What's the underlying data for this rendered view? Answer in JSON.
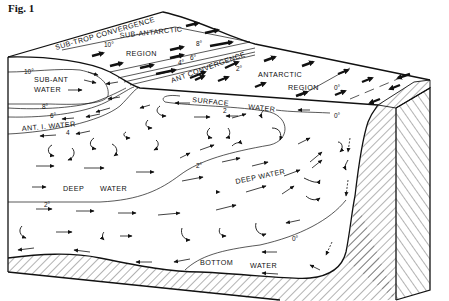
{
  "figure": {
    "title": "Fig. 1"
  },
  "surface_labels": {
    "sub_trop_convergence": "SUB-TROP CONVERGENCE",
    "sub_antarctic": "SUB-ANTARCTIC",
    "sub_antarctic_region": "REGION",
    "ant_convergence": "ANT CONVERGENCE",
    "antarctic": "ANTARCTIC",
    "antarctic_region": "REGION"
  },
  "water_masses": {
    "sub_ant_water_1": "SUB-ANT",
    "sub_ant_water_2": "WATER",
    "ant_i_water": "ANT. I. WATER",
    "surface_water_1": "SURFACE",
    "surface_water_2": "WATER",
    "deep_water_left_1": "DEEP",
    "deep_water_left_2": "WATER",
    "deep_water_right": "DEEP WATER",
    "bottom_water_1": "BOTTOM",
    "bottom_water_2": "WATER"
  },
  "isotherms": {
    "t10_surface": "10°",
    "t10_side": "10°",
    "t8_surface": "8°",
    "t8_side": "8°",
    "t6_surface": "6°",
    "t6_side": "6°",
    "t4_surface": "4°",
    "t4_side": "4",
    "t2_surface": "2°",
    "t2_surface_water": "2",
    "t2_deep_mid": "2°",
    "t2_deep_left": "2°",
    "t0_surface": "0°",
    "t0_surface_water": "0°",
    "t0_bottom": "0°"
  },
  "colors": {
    "ink": "#111111",
    "paper": "#ffffff"
  }
}
